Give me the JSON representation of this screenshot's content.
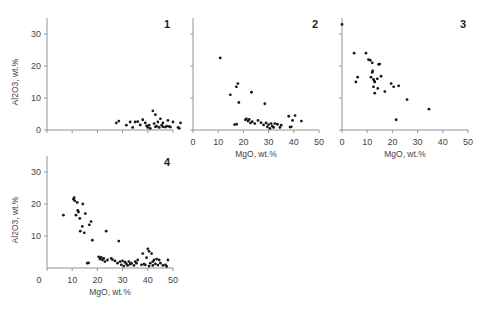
{
  "chart_data": [
    {
      "type": "scatter",
      "panel": "1",
      "xlabel": "",
      "ylabel": "Al2O3, wt.%",
      "xlim": [
        0,
        50
      ],
      "ylim": [
        0,
        35
      ],
      "yticks": [
        0,
        10,
        20,
        30
      ],
      "xticks": [
        0,
        10,
        20,
        30,
        40,
        50
      ],
      "show_xtick_labels": false,
      "show_ytick_labels": true,
      "points": [
        [
          27.5,
          2.2
        ],
        [
          28.5,
          2.8
        ],
        [
          31.5,
          1.5
        ],
        [
          33,
          2.5
        ],
        [
          34,
          0.8
        ],
        [
          35,
          2.5
        ],
        [
          36,
          2.6
        ],
        [
          37,
          1.6
        ],
        [
          38,
          3.2
        ],
        [
          39,
          2.2
        ],
        [
          39.5,
          1.3
        ],
        [
          40,
          0.8
        ],
        [
          40.5,
          1.5
        ],
        [
          42,
          6
        ],
        [
          43,
          4.8
        ],
        [
          43.5,
          1.2
        ],
        [
          44,
          2.5
        ],
        [
          44.5,
          0.8
        ],
        [
          45,
          3.5
        ],
        [
          45.5,
          1.5
        ],
        [
          46,
          1
        ],
        [
          46,
          2.2
        ],
        [
          47,
          0.9
        ],
        [
          47.5,
          1.2
        ],
        [
          48,
          3
        ],
        [
          48.5,
          1.1
        ],
        [
          49,
          0.9
        ],
        [
          50,
          2.5
        ],
        [
          52,
          0.8
        ],
        [
          52.5,
          0.5
        ],
        [
          53,
          2.2
        ],
        [
          41,
          0.5
        ],
        [
          42.5,
          2.0
        ],
        [
          43,
          1.0
        ]
      ]
    },
    {
      "type": "scatter",
      "panel": "2",
      "xlabel": "MgO, wt.%",
      "ylabel": "",
      "xlim": [
        0,
        50
      ],
      "ylim": [
        0,
        35
      ],
      "yticks": [
        0,
        10,
        20,
        30
      ],
      "xticks": [
        0,
        10,
        20,
        30,
        40,
        50
      ],
      "show_xtick_labels": true,
      "show_ytick_labels": false,
      "points": [
        [
          10.8,
          22.5
        ],
        [
          14.8,
          11
        ],
        [
          16.5,
          1.7
        ],
        [
          17.3,
          1.8
        ],
        [
          17.2,
          13.5
        ],
        [
          17.8,
          14.5
        ],
        [
          18.2,
          8.6
        ],
        [
          20.8,
          3.2
        ],
        [
          21.2,
          3.5
        ],
        [
          21.8,
          2.8
        ],
        [
          22.3,
          3.3
        ],
        [
          22.8,
          2.2
        ],
        [
          23.2,
          11.8
        ],
        [
          23.5,
          2.6
        ],
        [
          24.5,
          2
        ],
        [
          25.8,
          3
        ],
        [
          27,
          2.3
        ],
        [
          28,
          1.6
        ],
        [
          28.5,
          8.2
        ],
        [
          29,
          2.2
        ],
        [
          29.5,
          1
        ],
        [
          30,
          1.7
        ],
        [
          30.5,
          0.5
        ],
        [
          31,
          2
        ],
        [
          31.5,
          1.2
        ],
        [
          32,
          0.8
        ],
        [
          32.5,
          2
        ],
        [
          33.5,
          1.8
        ],
        [
          34.5,
          0.8
        ],
        [
          35,
          1.5
        ],
        [
          38,
          4.3
        ],
        [
          38.5,
          0.9
        ],
        [
          39,
          1
        ],
        [
          39.5,
          3
        ],
        [
          40.5,
          4.5
        ],
        [
          43,
          2.8
        ]
      ]
    },
    {
      "type": "scatter",
      "panel": "3",
      "xlabel": "MgO, wt.%",
      "ylabel": "",
      "xlim": [
        0,
        50
      ],
      "ylim": [
        0,
        35
      ],
      "yticks": [
        0,
        10,
        20,
        30
      ],
      "xticks": [
        0,
        10,
        20,
        30,
        40,
        50
      ],
      "show_xtick_labels": true,
      "show_ytick_labels": false,
      "points": [
        [
          0,
          33
        ],
        [
          4.8,
          24
        ],
        [
          5.5,
          15
        ],
        [
          6.2,
          16.5
        ],
        [
          9.5,
          24
        ],
        [
          10.5,
          22
        ],
        [
          11.2,
          21.8
        ],
        [
          11.5,
          16.5
        ],
        [
          12,
          21
        ],
        [
          12,
          18
        ],
        [
          12.5,
          15.8
        ],
        [
          12.2,
          18.5
        ],
        [
          12.5,
          13.5
        ],
        [
          13,
          15
        ],
        [
          13,
          11.5
        ],
        [
          14,
          16
        ],
        [
          14.2,
          13
        ],
        [
          14.5,
          20.5
        ],
        [
          15,
          20.6
        ],
        [
          15.5,
          16.8
        ],
        [
          17,
          12
        ],
        [
          19.5,
          14.5
        ],
        [
          20.5,
          13.5
        ],
        [
          21.5,
          3.2
        ],
        [
          22.5,
          13.8
        ],
        [
          25.8,
          9.5
        ],
        [
          34.5,
          6.5
        ],
        [
          12.8,
          15.3
        ]
      ]
    },
    {
      "type": "scatter",
      "panel": "4",
      "xlabel": "MgO, wt.%",
      "ylabel": "Al2O3, wt.%",
      "xlim": [
        0,
        50
      ],
      "ylim": [
        0,
        35
      ],
      "yticks": [
        10,
        20,
        30
      ],
      "xticks": [
        0,
        10,
        20,
        30,
        40,
        50
      ],
      "show_xtick_labels": true,
      "show_ytick_labels": true,
      "points": [
        [
          6.5,
          16.5
        ],
        [
          10.5,
          21.5
        ],
        [
          10.8,
          22
        ],
        [
          11,
          21
        ],
        [
          11.5,
          16.5
        ],
        [
          12,
          20.5
        ],
        [
          12.2,
          18
        ],
        [
          12.5,
          17.5
        ],
        [
          13,
          15.5
        ],
        [
          13.2,
          11.5
        ],
        [
          14,
          13
        ],
        [
          14.2,
          20
        ],
        [
          14.8,
          11
        ],
        [
          15.2,
          17
        ],
        [
          16,
          1.5
        ],
        [
          16.5,
          1.6
        ],
        [
          16.8,
          13.5
        ],
        [
          17.5,
          14.5
        ],
        [
          18,
          8.7
        ],
        [
          20.5,
          3.5
        ],
        [
          21,
          2.8
        ],
        [
          21.5,
          3.3
        ],
        [
          22,
          2.5
        ],
        [
          22.5,
          3
        ],
        [
          23,
          2
        ],
        [
          23.5,
          11.5
        ],
        [
          24,
          2.5
        ],
        [
          25.5,
          3
        ],
        [
          27,
          2.2
        ],
        [
          28,
          1.5
        ],
        [
          28.5,
          8.4
        ],
        [
          29,
          2
        ],
        [
          29.5,
          1
        ],
        [
          30,
          2.2
        ],
        [
          30.5,
          0.6
        ],
        [
          31,
          1.8
        ],
        [
          31.5,
          1.3
        ],
        [
          32,
          0.8
        ],
        [
          32.5,
          2
        ],
        [
          33.5,
          1.5
        ],
        [
          34.5,
          0.8
        ],
        [
          35,
          2
        ],
        [
          35.5,
          1.5
        ],
        [
          36,
          2.5
        ],
        [
          37.5,
          1
        ],
        [
          38,
          4.5
        ],
        [
          38.5,
          1.2
        ],
        [
          39,
          1
        ],
        [
          39.5,
          3.2
        ],
        [
          40,
          6
        ],
        [
          40.5,
          5.2
        ],
        [
          41,
          1.5
        ],
        [
          41.5,
          4.5
        ],
        [
          42,
          0.8
        ],
        [
          42.5,
          2.5
        ],
        [
          43,
          1.3
        ],
        [
          43.5,
          2.8
        ],
        [
          44,
          0.9
        ],
        [
          44.5,
          2.5
        ],
        [
          45,
          1.5
        ],
        [
          46,
          0.8
        ],
        [
          47,
          1
        ],
        [
          48,
          2.5
        ],
        [
          47.5,
          0.5
        ],
        [
          42,
          2
        ],
        [
          40.5,
          0.6
        ],
        [
          26,
          2.6
        ],
        [
          33,
          1.2
        ]
      ]
    }
  ],
  "figure": {
    "panel_labels": [
      "1",
      "2",
      "3",
      "4"
    ],
    "ylabel_text": "Al2O3, wt.%",
    "xlabel_text": "MgO, wt.%"
  }
}
